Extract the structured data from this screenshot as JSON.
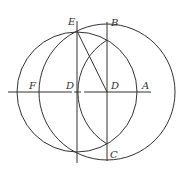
{
  "diagram": {
    "type": "geometric-construction",
    "labels": {
      "E": "E",
      "B": "B",
      "F": "F",
      "D_left": "D",
      "D_right": "D",
      "A": "A",
      "C": "C"
    },
    "colors": {
      "line": "#333333",
      "background": "#ffffff"
    }
  }
}
